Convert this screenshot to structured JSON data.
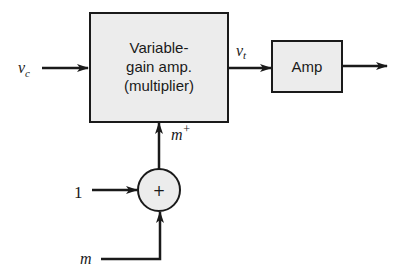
{
  "diagram": {
    "blocks": [
      {
        "id": "vga",
        "lines": [
          "Variable-",
          "gain amp.",
          "(multiplier)"
        ]
      },
      {
        "id": "amp",
        "lines": [
          "Amp"
        ]
      }
    ],
    "summer": {
      "symbol": "+"
    },
    "signals": {
      "input_vc": {
        "main": "v",
        "sub": "c"
      },
      "vt": {
        "main": "v",
        "sub": "t"
      },
      "m_plus": {
        "main": "m",
        "sup": "+"
      },
      "one": "1",
      "m": "m"
    },
    "colors": {
      "block_fill": "#ececec",
      "stroke": "#1a1a1a"
    }
  }
}
